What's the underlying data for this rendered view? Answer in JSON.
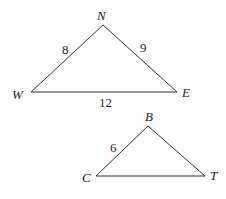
{
  "diagram": {
    "stroke_color": "#333333",
    "triangles": [
      {
        "name": "NWE",
        "vertices": [
          {
            "label": "N",
            "x": 103,
            "y": 25
          },
          {
            "label": "W",
            "x": 31,
            "y": 92
          },
          {
            "label": "E",
            "x": 177,
            "y": 92
          }
        ],
        "sides": [
          {
            "between": "W-N",
            "label": "8"
          },
          {
            "between": "N-E",
            "label": "9"
          },
          {
            "between": "W-E",
            "label": "12"
          }
        ]
      },
      {
        "name": "BCT",
        "vertices": [
          {
            "label": "B",
            "x": 148,
            "y": 126
          },
          {
            "label": "C",
            "x": 96,
            "y": 176
          },
          {
            "label": "T",
            "x": 205,
            "y": 176
          }
        ],
        "sides": [
          {
            "between": "C-B",
            "label": "6"
          }
        ]
      }
    ]
  }
}
